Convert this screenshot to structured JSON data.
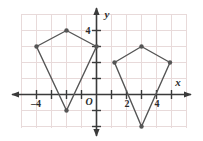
{
  "chart_data": {
    "type": "scatter",
    "title": "",
    "xlabel": "x",
    "ylabel": "y",
    "grid": true,
    "legend": false,
    "xlim": [
      -5.5,
      6.0
    ],
    "ylim": [
      -3.0,
      5.5
    ],
    "x_ticks": [
      -4,
      2,
      4
    ],
    "x_tick_labels": [
      "–4",
      "2",
      "4"
    ],
    "y_ticks": [
      4
    ],
    "y_tick_labels": [
      "4"
    ],
    "origin_label": "O",
    "grid_step": 1,
    "series": [
      {
        "name": "preimage-quadrilateral",
        "closed": true,
        "points": [
          {
            "x": -2,
            "y": 4
          },
          {
            "x": 0,
            "y": 3
          },
          {
            "x": -2,
            "y": -1
          },
          {
            "x": -4,
            "y": 3
          }
        ]
      },
      {
        "name": "image-quadrilateral",
        "closed": true,
        "points": [
          {
            "x": 3,
            "y": 3
          },
          {
            "x": 4.9,
            "y": 2
          },
          {
            "x": 3,
            "y": -2
          },
          {
            "x": 1.2,
            "y": 2
          }
        ]
      }
    ]
  },
  "style": {
    "grid_color": "#e8dada",
    "axis_color": "#3a3a3a",
    "shape_stroke": "#555555",
    "vertex_fill": "#555555",
    "background": "#ffffff"
  },
  "axis_labels": {
    "x_axis": "x",
    "y_axis": "y"
  },
  "tick_labels": {
    "x_neg_four": "–4",
    "x_two": "2",
    "x_four": "4",
    "y_four": "4",
    "origin": "O"
  }
}
